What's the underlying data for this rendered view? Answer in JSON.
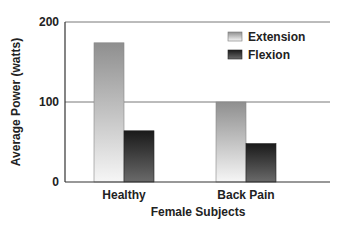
{
  "chart_data": {
    "type": "bar",
    "title": "",
    "xlabel": "Female Subjects",
    "ylabel": "Average Power (watts)",
    "ylim": [
      0,
      200
    ],
    "yticks": [
      0,
      100,
      200
    ],
    "ytick_labels": [
      "0",
      "100",
      "200"
    ],
    "grid": true,
    "categories": [
      "Healthy",
      "Back Pain"
    ],
    "series": [
      {
        "name": "Extension",
        "values": [
          174,
          100
        ],
        "color": "#9a9a9a"
      },
      {
        "name": "Flexion",
        "values": [
          64,
          48
        ],
        "color": "#2e2e2e"
      }
    ],
    "legend": {
      "placement": "top-right",
      "entries": [
        "Extension",
        "Flexion"
      ]
    }
  }
}
